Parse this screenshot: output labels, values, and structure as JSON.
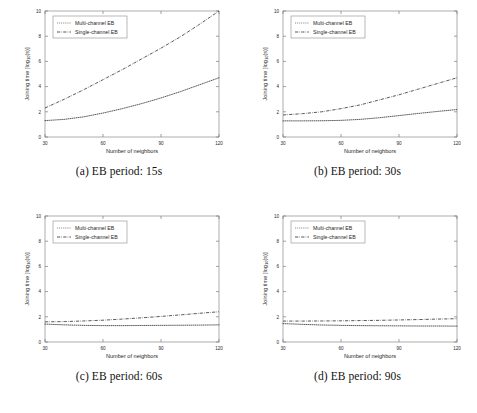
{
  "figure": {
    "layout": "2x2-grid",
    "background": "#ffffff",
    "line_color": "#3a3a3a"
  },
  "axes": {
    "xlabel": "Number of neighbors",
    "ylabel": "Joining time [log10(s)]",
    "ylabel_display": "Joining time [log",
    "ylabel_sub": "10",
    "ylabel_tail": "(s)]",
    "xticks": [
      "30",
      "60",
      "90",
      "120"
    ],
    "yticks": [
      "0",
      "2",
      "4",
      "6",
      "8",
      "10"
    ],
    "xlim": [
      30,
      120
    ],
    "ylim": [
      0,
      10
    ]
  },
  "legend": {
    "position": "upper-left",
    "entries": [
      {
        "label": "Multi-channel EB",
        "style": "dotted"
      },
      {
        "label": "Single-channel EB",
        "style": "dash-dot"
      }
    ]
  },
  "chart_data": [
    {
      "type": "line",
      "id": "a",
      "caption": "(a) EB period: 15s",
      "title": "",
      "xlabel": "Number of neighbors",
      "ylabel": "Joining time [log10(s)]",
      "xlim": [
        30,
        120
      ],
      "ylim": [
        0,
        10
      ],
      "grid": false,
      "legend": "upper-left",
      "x": [
        30,
        40,
        50,
        60,
        70,
        80,
        90,
        100,
        110,
        120
      ],
      "series": [
        {
          "name": "Multi-channel EB",
          "style": "dotted",
          "values": [
            1.3,
            1.4,
            1.6,
            1.9,
            2.25,
            2.65,
            3.1,
            3.6,
            4.15,
            4.7
          ]
        },
        {
          "name": "Single-channel EB",
          "style": "dash-dot",
          "values": [
            2.3,
            3.0,
            3.75,
            4.55,
            5.35,
            6.2,
            7.05,
            7.95,
            8.95,
            10.0
          ]
        }
      ]
    },
    {
      "type": "line",
      "id": "b",
      "caption": "(b) EB period: 30s",
      "title": "",
      "xlabel": "Number of neighbors",
      "ylabel": "Joining time [log10(s)]",
      "xlim": [
        30,
        120
      ],
      "ylim": [
        0,
        10
      ],
      "grid": false,
      "legend": "upper-left",
      "x": [
        30,
        40,
        50,
        60,
        70,
        80,
        90,
        100,
        110,
        120
      ],
      "series": [
        {
          "name": "Multi-channel EB",
          "style": "dotted",
          "values": [
            1.28,
            1.28,
            1.29,
            1.32,
            1.4,
            1.53,
            1.7,
            1.87,
            2.03,
            2.18
          ]
        },
        {
          "name": "Single-channel EB",
          "style": "dash-dot",
          "values": [
            1.75,
            1.85,
            2.0,
            2.25,
            2.55,
            2.95,
            3.35,
            3.8,
            4.25,
            4.7
          ]
        }
      ]
    },
    {
      "type": "line",
      "id": "c",
      "caption": "(c) EB period: 60s",
      "title": "",
      "xlabel": "Number of neighbors",
      "ylabel": "Joining time [log10(s)]",
      "xlim": [
        30,
        120
      ],
      "ylim": [
        0,
        10
      ],
      "grid": false,
      "legend": "upper-left",
      "x": [
        30,
        40,
        50,
        60,
        70,
        80,
        90,
        100,
        110,
        120
      ],
      "series": [
        {
          "name": "Multi-channel EB",
          "style": "dotted",
          "values": [
            1.42,
            1.36,
            1.32,
            1.3,
            1.3,
            1.31,
            1.32,
            1.33,
            1.34,
            1.36
          ]
        },
        {
          "name": "Single-channel EB",
          "style": "dash-dot",
          "values": [
            1.6,
            1.62,
            1.67,
            1.73,
            1.82,
            1.92,
            2.03,
            2.15,
            2.28,
            2.4
          ]
        }
      ]
    },
    {
      "type": "line",
      "id": "d",
      "caption": "(d) EB period: 90s",
      "title": "",
      "xlabel": "Number of neighbors",
      "ylabel": "Joining time [log10(s)]",
      "xlim": [
        30,
        120
      ],
      "ylim": [
        0,
        10
      ],
      "grid": false,
      "legend": "upper-left",
      "x": [
        30,
        40,
        50,
        60,
        70,
        80,
        90,
        100,
        110,
        120
      ],
      "series": [
        {
          "name": "Multi-channel EB",
          "style": "dotted",
          "values": [
            1.46,
            1.4,
            1.35,
            1.32,
            1.3,
            1.29,
            1.28,
            1.27,
            1.27,
            1.26
          ]
        },
        {
          "name": "Single-channel EB",
          "style": "dash-dot",
          "values": [
            1.66,
            1.66,
            1.67,
            1.68,
            1.7,
            1.72,
            1.75,
            1.78,
            1.82,
            1.85
          ]
        }
      ]
    }
  ]
}
